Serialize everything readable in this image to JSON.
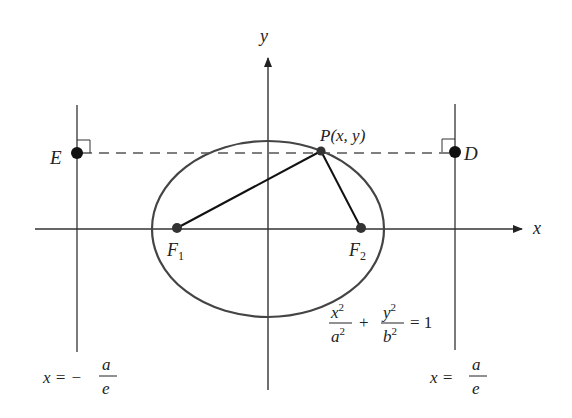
{
  "labels": {
    "y_axis": "y",
    "x_axis": "x",
    "point_P": "P(x, y)",
    "point_E": "E",
    "point_D": "D",
    "focus1_base": "F",
    "focus1_sub": "1",
    "focus2_base": "F",
    "focus2_sub": "2"
  },
  "equation": {
    "num1": "x",
    "num1_exp": "2",
    "den1": "a",
    "den1_exp": "2",
    "plus": "+",
    "num2": "y",
    "num2_exp": "2",
    "den2": "b",
    "den2_exp": "2",
    "rhs": "= 1"
  },
  "directrix_left": {
    "lhs": "x = −",
    "num": "a",
    "den": "e"
  },
  "directrix_right": {
    "lhs": "x =",
    "num": "a",
    "den": "e"
  },
  "colors": {
    "ink": "#222222",
    "ellipse": "#444444",
    "dash": "#555555"
  }
}
